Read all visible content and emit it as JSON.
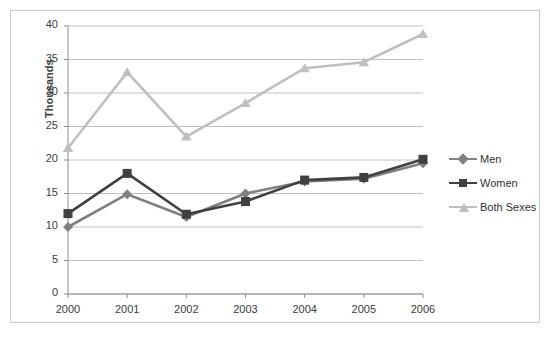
{
  "chart_data": {
    "type": "line",
    "title": "",
    "subtitle": "",
    "xlabel": "",
    "ylabel": "Thousands",
    "categories": [
      "2000",
      "2001",
      "2002",
      "2003",
      "2004",
      "2005",
      "2006"
    ],
    "x": [
      2000,
      2001,
      2002,
      2003,
      2004,
      2005,
      2006
    ],
    "ylim": [
      0,
      40
    ],
    "ytick_step": 5,
    "yticks": [
      "0",
      "5",
      "10",
      "15",
      "20",
      "25",
      "30",
      "35",
      "40"
    ],
    "grid": "horizontal",
    "legend_position": "right",
    "series": [
      {
        "name": "Men",
        "color": "#808080",
        "marker": "diamond",
        "values": [
          10.0,
          14.9,
          11.5,
          15.0,
          16.8,
          17.2,
          19.5
        ]
      },
      {
        "name": "Women",
        "color": "#404040",
        "marker": "square",
        "values": [
          12.0,
          18.0,
          11.9,
          13.8,
          17.0,
          17.4,
          20.1
        ]
      },
      {
        "name": "Both Sexes",
        "color": "#bfbfbf",
        "marker": "triangle",
        "values": [
          21.8,
          33.1,
          23.5,
          28.5,
          33.7,
          34.6,
          38.8
        ]
      }
    ]
  },
  "legend": {
    "items": [
      {
        "label": "Men"
      },
      {
        "label": "Women"
      },
      {
        "label": "Both Sexes"
      }
    ]
  },
  "colors": {
    "men": "#808080",
    "women": "#404040",
    "both_sexes": "#bfbfbf",
    "gridline": "#c0c0c0",
    "axis": "#8c8c8c",
    "frame": "#c9c9c9",
    "text": "#3c3c3c"
  }
}
